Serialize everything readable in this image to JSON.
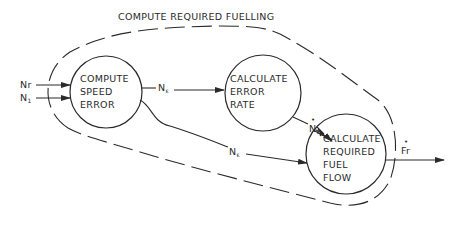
{
  "title": "COMPUTE REQUIRED FUELLING",
  "colors": {
    "ink": "#2a2a2a",
    "background": "#ffffff"
  },
  "inputs": [
    {
      "label": "Nr"
    },
    {
      "label": "N",
      "subscript": "1"
    }
  ],
  "output": {
    "label": "Fr",
    "dot": "•"
  },
  "nodes": [
    {
      "id": "compute-speed-error",
      "lines": [
        "COMPUTE",
        "SPEED",
        "ERROR"
      ]
    },
    {
      "id": "calculate-error-rate",
      "lines": [
        "CALCULATE",
        "ERROR",
        "RATE"
      ]
    },
    {
      "id": "calculate-required-fuel-flow",
      "lines": [
        "CALCULATE",
        "REQUIRED",
        "FUEL",
        "FLOW"
      ]
    }
  ],
  "flows": [
    {
      "from": "compute-speed-error",
      "to": "calculate-error-rate",
      "label": "N",
      "subscript": "ε"
    },
    {
      "from": "calculate-error-rate",
      "to": "calculate-required-fuel-flow",
      "label": "N",
      "subscript": "ε",
      "dot": "•"
    },
    {
      "from": "compute-speed-error",
      "to": "calculate-required-fuel-flow",
      "label": "N",
      "subscript": "ε"
    }
  ]
}
